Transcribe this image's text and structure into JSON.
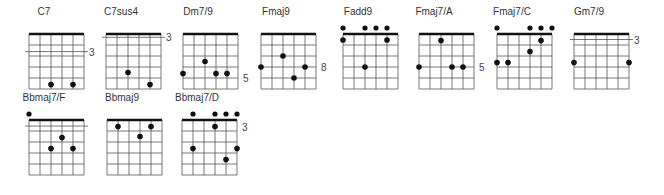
{
  "colors": {
    "line": "#555555",
    "nut": "#111111",
    "dot": "#111111",
    "text": "#333333"
  },
  "chords": [
    {
      "name": "C7",
      "x": 4,
      "y": 6,
      "gx": 25,
      "fret_label": "3",
      "fret_label_row": 1.6,
      "offset_line": 1.6,
      "top_dots": [],
      "dots": [
        [
          2,
          4.6
        ],
        [
          4,
          4.6
        ]
      ]
    },
    {
      "name": "C7sus4",
      "x": 81,
      "y": 6,
      "gx": 25,
      "fret_label": "3",
      "fret_label_row": 0.3,
      "offset_line": 0.3,
      "top_dots": [],
      "dots": [
        [
          2,
          3.5
        ],
        [
          4,
          4.6
        ]
      ]
    },
    {
      "name": "Dm7/9",
      "x": 158,
      "y": 6,
      "gx": 25,
      "fret_label": "5",
      "fret_label_row": 4.0,
      "offset_line": null,
      "top_dots": [],
      "dots": [
        [
          2,
          2.5
        ],
        [
          0,
          3.6
        ],
        [
          3,
          3.6
        ],
        [
          4,
          3.6
        ]
      ]
    },
    {
      "name": "Fmaj9",
      "x": 236,
      "y": 6,
      "gx": 25,
      "fret_label": "8",
      "fret_label_row": 3.0,
      "offset_line": null,
      "top_dots": [],
      "dots": [
        [
          2,
          2.0
        ],
        [
          0,
          3.0
        ],
        [
          4,
          3.0
        ],
        [
          3,
          4.0
        ]
      ]
    },
    {
      "name": "Fadd9",
      "x": 318,
      "y": 6,
      "gx": 25,
      "fret_label": "",
      "fret_label_row": 0,
      "offset_line": null,
      "top_dots": [
        0,
        2,
        3,
        4
      ],
      "dots": [
        [
          0,
          0.55
        ],
        [
          4,
          0.55
        ],
        [
          2,
          3.0
        ]
      ]
    },
    {
      "name": "Fmaj7/A",
      "x": 394,
      "y": 6,
      "gx": 25,
      "fret_label": "5",
      "fret_label_row": 3.0,
      "offset_line": null,
      "top_dots": [],
      "dots": [
        [
          2,
          0.6
        ],
        [
          0,
          3.0
        ],
        [
          3,
          3.0
        ],
        [
          4,
          3.0
        ]
      ]
    },
    {
      "name": "Fmaj7/C",
      "x": 472,
      "y": 6,
      "gx": 25,
      "fret_label": "",
      "fret_label_row": 0,
      "offset_line": null,
      "top_dots": [
        0,
        3,
        4,
        5
      ],
      "dots": [
        [
          4,
          0.6
        ],
        [
          3,
          1.6
        ],
        [
          0,
          2.6
        ],
        [
          1,
          2.6
        ]
      ]
    },
    {
      "name": "Gm7/9",
      "x": 549,
      "y": 6,
      "gx": 25,
      "fret_label": "3",
      "fret_label_row": 0.5,
      "offset_line": 0.5,
      "top_dots": [],
      "dots": [
        [
          0,
          2.6
        ],
        [
          5,
          2.6
        ]
      ]
    },
    {
      "name": "Bbmaj7/F",
      "x": 4,
      "y": 92,
      "gx": 25,
      "fret_label": "",
      "fret_label_row": 0,
      "offset_line": 0.55,
      "top_dots": [
        0
      ],
      "dots": [
        [
          3,
          1.6
        ],
        [
          2,
          2.6
        ],
        [
          4,
          2.6
        ]
      ]
    },
    {
      "name": "Bbmaj9",
      "x": 82,
      "y": 92,
      "gx": 25,
      "fret_label": "",
      "fret_label_row": 0,
      "offset_line": null,
      "top_dots": [],
      "dots": [
        [
          1,
          0.6
        ],
        [
          4,
          0.6
        ],
        [
          3,
          1.5
        ]
      ]
    },
    {
      "name": "Bbmaj7/D",
      "x": 157,
      "y": 92,
      "gx": 25,
      "fret_label": "3",
      "fret_label_row": 0.6,
      "offset_line": null,
      "top_dots": [
        1,
        3,
        4,
        5
      ],
      "dots": [
        [
          3,
          0.6
        ],
        [
          1,
          2.6
        ],
        [
          5,
          2.6
        ],
        [
          4,
          3.6
        ]
      ]
    }
  ]
}
